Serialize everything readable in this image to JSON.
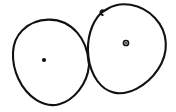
{
  "canvas": {
    "width": 176,
    "height": 112,
    "background_color": "#ffffff",
    "ink_color": "#111111",
    "stroke_width": 2.1,
    "description": "Hand-drawn sketch of two overlapping closed loops, each containing a small marked center point"
  },
  "shapes": [
    {
      "id": "left-loop",
      "name": "left-circle",
      "label": "Left hand-drawn circle",
      "center": {
        "x": 50,
        "y": 62
      },
      "bounds": {
        "x": 13,
        "y": 19,
        "width": 78,
        "height": 87
      },
      "closed": true,
      "center_point": {
        "name": "left-center-dot",
        "label": "Left center point",
        "style": "solid",
        "x": 44,
        "y": 60,
        "radius": 2.1
      }
    },
    {
      "id": "right-loop",
      "name": "right-circle",
      "label": "Right hand-drawn circle",
      "center": {
        "x": 127,
        "y": 49
      },
      "bounds": {
        "x": 88,
        "y": 4,
        "width": 78,
        "height": 90
      },
      "closed": true,
      "has_pen_start_tail": true,
      "center_point": {
        "name": "right-center-dot",
        "label": "Right center point",
        "style": "ring",
        "x": 126,
        "y": 43,
        "radius": 3.1
      }
    }
  ],
  "annotations": {
    "intersection_label": "The two loops touch near x=89, y=62",
    "stroke_count": 3
  }
}
